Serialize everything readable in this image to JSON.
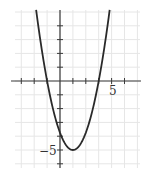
{
  "chart_data": {
    "type": "line",
    "title": "",
    "xlabel": "",
    "ylabel": "",
    "function": "y = 1.25(x + 1)(x - 3)",
    "vertex": [
      1,
      -5
    ],
    "x_intercepts": [
      -1,
      3
    ],
    "y_intercept": -3.75,
    "x": [
      -1.85,
      -1.5,
      -1,
      -0.5,
      0,
      0.5,
      1,
      1.5,
      2,
      2.5,
      3,
      3.5,
      3.85
    ],
    "y": [
      5.14,
      2.81,
      0,
      -2.19,
      -3.75,
      -4.69,
      -5,
      -4.69,
      -3.75,
      -2.19,
      0,
      2.81,
      5.14
    ],
    "xlim": [
      -3.8,
      6.3
    ],
    "ylim": [
      -6.5,
      5.2
    ],
    "x_ticks": [
      -3,
      -2,
      -1,
      1,
      2,
      3,
      4,
      5
    ],
    "y_ticks": [
      -6,
      -5,
      -4,
      -3,
      -2,
      -1,
      1,
      2,
      3,
      4
    ],
    "tick_labels": {
      "x": "5",
      "y": "−5"
    },
    "grid": true,
    "legend": null
  },
  "labels": {
    "x_tick_label": "5",
    "y_tick_label": "−5"
  },
  "colors": {
    "curve": "#2a2a2a",
    "axis": "#3a3a3a",
    "grid": "#e6e6e6",
    "background": "#ffffff"
  }
}
